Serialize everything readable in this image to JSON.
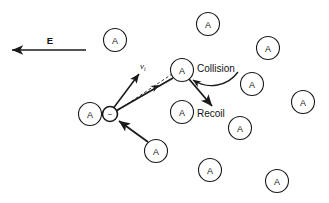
{
  "figure": {
    "type": "physics-diagram",
    "title_text": "",
    "background_color": "#ffffff",
    "ink_color": "#1a1a1a"
  },
  "labels": {
    "field": "E",
    "velocity": "v",
    "velocity_subscript": "i",
    "collision": "Collision",
    "recoil": "Recoil",
    "atom_symbol": "A",
    "electron_sign": "−"
  },
  "field_arrow": {
    "name": "electric-field-arrow",
    "direction": "left",
    "x_start": 86,
    "x_end": 12,
    "y": 50,
    "label_x": 50,
    "label_y": 40
  },
  "electron": {
    "name": "electron-particle",
    "cx": 110,
    "cy": 114,
    "r": 7.5,
    "sign": "−"
  },
  "atoms": [
    {
      "id": "atom-upper-left",
      "cx": 115,
      "cy": 40,
      "r": 11.5,
      "label": "A"
    },
    {
      "id": "atom-top-center",
      "cx": 208,
      "cy": 24,
      "r": 11.5,
      "label": "A"
    },
    {
      "id": "atom-top-right",
      "cx": 268,
      "cy": 48,
      "r": 11.5,
      "label": "A"
    },
    {
      "id": "atom-collision",
      "cx": 182,
      "cy": 70,
      "r": 11.5,
      "label": "A"
    },
    {
      "id": "atom-mid-right",
      "cx": 252,
      "cy": 84,
      "r": 11.5,
      "label": "A"
    },
    {
      "id": "atom-far-right",
      "cx": 303,
      "cy": 102,
      "r": 11.5,
      "label": "A"
    },
    {
      "id": "atom-electron-host",
      "cx": 90,
      "cy": 114,
      "r": 11.5,
      "label": "A"
    },
    {
      "id": "atom-recoil",
      "cx": 182,
      "cy": 112,
      "r": 11.5,
      "label": "A"
    },
    {
      "id": "atom-right-lower",
      "cx": 240,
      "cy": 128,
      "r": 11.5,
      "label": "A"
    },
    {
      "id": "atom-bottom-left",
      "cx": 156,
      "cy": 151,
      "r": 11.5,
      "label": "A"
    },
    {
      "id": "atom-bottom-center",
      "cx": 210,
      "cy": 170,
      "r": 11.5,
      "label": "A"
    },
    {
      "id": "atom-bottom-right",
      "cx": 277,
      "cy": 181,
      "r": 11.5,
      "label": "A"
    }
  ],
  "vectors": {
    "initial_velocity": {
      "name": "initial-velocity-arrow",
      "x1": 112,
      "y1": 110,
      "x2": 139,
      "y2": 74,
      "label_x": 140,
      "label_y": 66
    },
    "drift_path": {
      "name": "drift-trajectory-arrow",
      "x1": 114,
      "y1": 112,
      "x2": 173,
      "y2": 78,
      "mid_arrow_x": 152,
      "mid_arrow_y": 89
    },
    "dashed_path": {
      "name": "dashed-reference-line",
      "x1": 114,
      "y1": 113,
      "x2": 175,
      "y2": 72
    },
    "incoming": {
      "name": "incoming-electron-arrow",
      "x1": 148,
      "y1": 142,
      "x2": 119,
      "y2": 121
    },
    "recoil": {
      "name": "recoil-arrow",
      "x1": 189,
      "y1": 79,
      "x2": 212,
      "y2": 106
    },
    "collision_pointer": {
      "name": "collision-callout-curve",
      "path": "M 238 72 C 228 86 208 90 193 80"
    }
  },
  "text_labels": [
    {
      "id": "collision-text",
      "text": "Collision",
      "x": 197,
      "y": 68
    },
    {
      "id": "recoil-text",
      "text": "Recoil",
      "x": 197,
      "y": 113
    }
  ]
}
